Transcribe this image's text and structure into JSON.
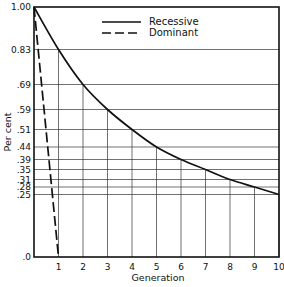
{
  "chart_data": {
    "type": "line",
    "title": "",
    "xlabel": "Generation",
    "ylabel": "Per cent",
    "xlim": [
      0,
      10
    ],
    "ylim": [
      0,
      1.0
    ],
    "grid": true,
    "legend_position": "top-center",
    "x_ticks": [
      "1",
      "2",
      "3",
      "4",
      "5",
      "6",
      "7",
      "8",
      "9",
      "10"
    ],
    "y_ticks": [
      {
        "value": 1.0,
        "label": "1.00"
      },
      {
        "value": 0.83,
        "label": "0.83"
      },
      {
        "value": 0.69,
        "label": ".69"
      },
      {
        "value": 0.59,
        "label": ".59"
      },
      {
        "value": 0.51,
        "label": ".51"
      },
      {
        "value": 0.44,
        "label": ".44"
      },
      {
        "value": 0.39,
        "label": ".39"
      },
      {
        "value": 0.35,
        "label": ".35"
      },
      {
        "value": 0.31,
        "label": ".31"
      },
      {
        "value": 0.28,
        "label": ".28"
      },
      {
        "value": 0.25,
        "label": ".25"
      },
      {
        "value": 0.0,
        "label": ".0"
      }
    ],
    "series": [
      {
        "name": "Recessive",
        "style": "solid",
        "x": [
          0,
          1,
          2,
          3,
          4,
          5,
          6,
          7,
          8,
          9,
          10
        ],
        "values": [
          1.0,
          0.83,
          0.69,
          0.59,
          0.51,
          0.44,
          0.39,
          0.35,
          0.31,
          0.28,
          0.25
        ]
      },
      {
        "name": "Dominant",
        "style": "dashed",
        "x": [
          0,
          1
        ],
        "values": [
          1.0,
          0.0
        ]
      }
    ]
  },
  "colors": {
    "line": "#111111",
    "grid": "#333333",
    "background": "#ffffff"
  }
}
